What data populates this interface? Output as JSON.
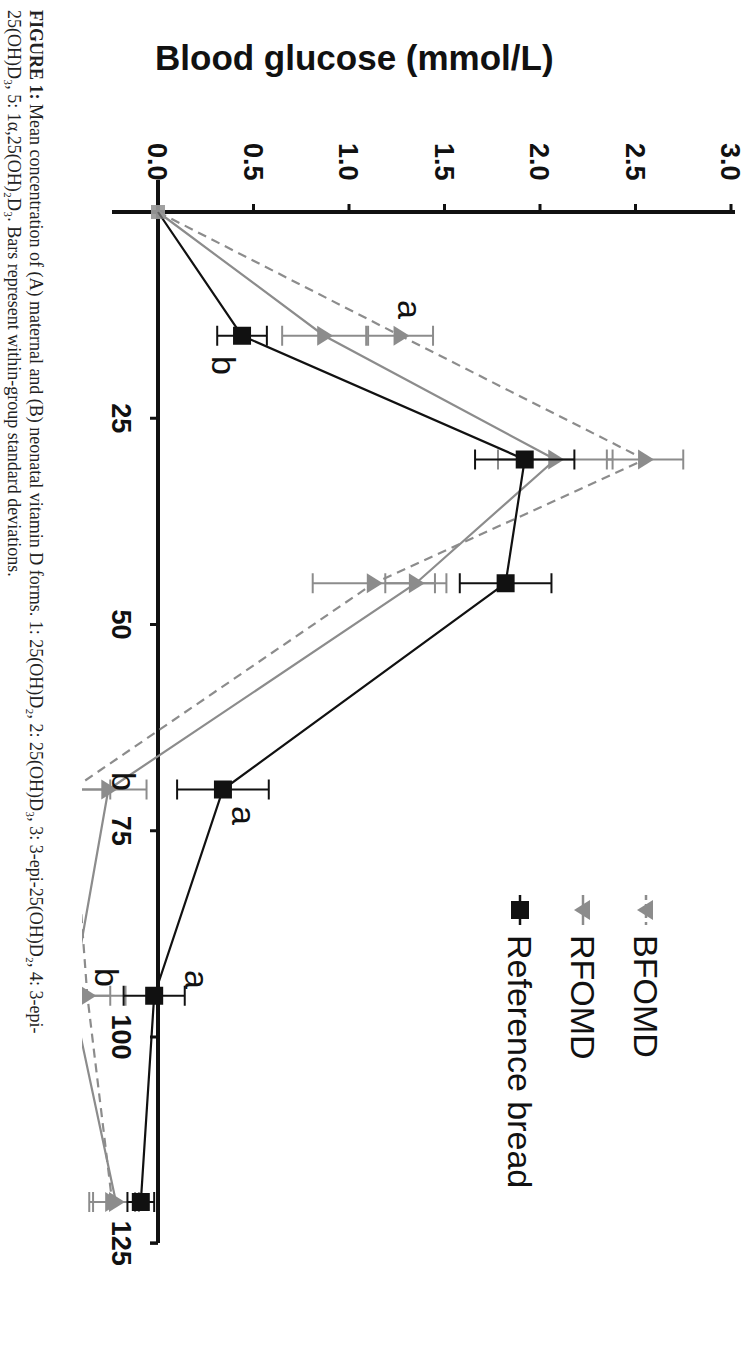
{
  "figure": {
    "axis_title": "Blood glucose (mmol/L)",
    "caption_prefix": "FIGURE 1:",
    "caption_line1": "Mean concentration of (A) maternal and (B) neonatal vitamin D forms. 1: 25(OH)D₂, 2: 25(OH)D₃, 3: 3-epi-25(OH)D₂, 4: 3-epi-",
    "caption_line2": "25(OH)D₃, 5: 1α,25(OH)₂D₃. Bars represent within-group standard deviations.",
    "legend": [
      {
        "label": "BFOMD",
        "marker": "triangle",
        "color": "#8c8c8c",
        "dash": "dashed"
      },
      {
        "label": "RFOMD",
        "marker": "triangle",
        "color": "#8c8c8c",
        "dash": "solid"
      },
      {
        "label": "Reference bread",
        "marker": "square",
        "color": "#111111",
        "dash": "solid"
      }
    ],
    "y_ticks": [
      "0.0",
      "0.5",
      "1.0",
      "1.5",
      "2.0",
      "2.5",
      "3.0"
    ],
    "x_ticks": [
      "25",
      "50",
      "75",
      "100",
      "125"
    ],
    "annotations": [
      {
        "text": "a",
        "near": "BFOMD t=15"
      },
      {
        "text": "b",
        "near": "Reference t=15"
      },
      {
        "text": "b",
        "near": "RFOMD/BFOMD t=70"
      },
      {
        "text": "a",
        "near": "Reference t=70"
      },
      {
        "text": "b",
        "near": "RFOMD/BFOMD t=95"
      },
      {
        "text": "a",
        "near": "Reference t=95"
      }
    ]
  },
  "chart_data": {
    "type": "line",
    "title": "",
    "xlabel": "Time (min)",
    "ylabel": "Blood glucose (mmol/L)",
    "orientation_note": "figure rotated 90 degrees clockwise",
    "xlim": [
      0,
      125
    ],
    "ylim": [
      0,
      3.0
    ],
    "x": [
      0,
      15,
      30,
      45,
      70,
      95,
      120
    ],
    "series": [
      {
        "name": "BFOMD",
        "style": "dashed gray, triangle",
        "values": [
          0.0,
          1.27,
          2.55,
          1.13,
          -0.45,
          -0.37,
          -0.24
        ],
        "sd": [
          0.0,
          0.17,
          0.2,
          0.32,
          0.2,
          0.2,
          0.12
        ]
      },
      {
        "name": "RFOMD",
        "style": "solid gray, triangle",
        "values": [
          0.0,
          0.87,
          2.08,
          1.35,
          -0.26,
          -0.45,
          -0.22
        ],
        "sd": [
          0.0,
          0.22,
          0.3,
          0.16,
          0.2,
          0.2,
          0.12
        ]
      },
      {
        "name": "Reference bread",
        "style": "solid black, square",
        "values": [
          0.0,
          0.44,
          1.92,
          1.82,
          0.34,
          -0.02,
          -0.09
        ],
        "sd": [
          0.0,
          0.13,
          0.26,
          0.24,
          0.24,
          0.16,
          0.07
        ]
      }
    ],
    "significance_letters": {
      "15": {
        "BFOMD": "a",
        "Reference bread": "b"
      },
      "70": {
        "Reference bread": "a",
        "RFOMD": "b"
      },
      "95": {
        "Reference bread": "a",
        "RFOMD": "b"
      }
    },
    "grid": false,
    "legend_position": "upper right (rotated)"
  }
}
